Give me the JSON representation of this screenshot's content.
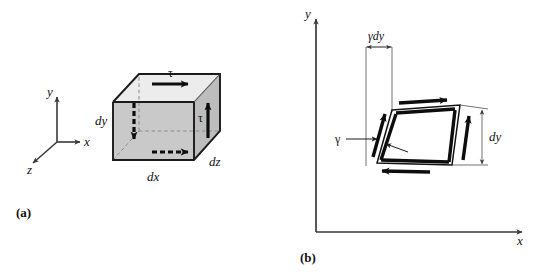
{
  "figure": {
    "panels": [
      {
        "tag": "(a)",
        "description": "differential element with shear stress tau on cube faces",
        "axes": {
          "y_label": "y",
          "x_label": "x",
          "z_label": "z"
        },
        "dimension_labels": {
          "dy": "dy",
          "dx": "dx",
          "dz": "dz"
        },
        "stress_labels": {
          "tau_top": "τ",
          "tau_right": "τ"
        }
      },
      {
        "tag": "(b)",
        "description": "sheared parallelogram element showing shear strain gamma",
        "axes": {
          "y_label": "y",
          "x_label": "x"
        },
        "dimension_labels": {
          "gamma_dy": "γdy",
          "dy": "dy"
        },
        "strain_labels": {
          "gamma": "γ"
        }
      }
    ],
    "colors": {
      "front_face": "#c9c9c9",
      "right_face": "#bdbdbd",
      "top_face": "#ececec",
      "edge": "#1a1a1a",
      "axis": "#3a3a3a",
      "hidden_edge": "#8a8a8a",
      "background": "#ffffff"
    }
  }
}
